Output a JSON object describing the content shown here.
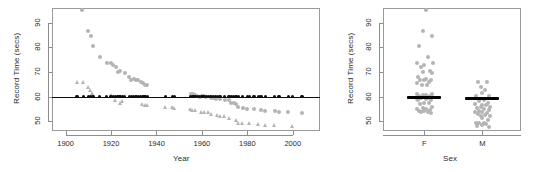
{
  "figure": {
    "background": "#ffffff",
    "point_color_gray": "#b4b4b4",
    "point_color_black": "#0d0d0d",
    "frame_color": "#9a9a9a"
  },
  "chart_data": [
    {
      "type": "scatter",
      "panel": "left",
      "title": "",
      "xlabel": "Year",
      "ylabel": "Record Time (secs)",
      "xlim": [
        1894,
        2012
      ],
      "ylim": [
        46,
        96
      ],
      "xticks": [
        1900,
        1920,
        1940,
        1960,
        1980,
        2000
      ],
      "yticks": [
        50,
        60,
        70,
        80,
        90
      ],
      "grid": false,
      "legend": "none",
      "annotations": [
        {
          "kind": "hline",
          "y": 60,
          "color": "#0d0d0d",
          "label": "reference line at 60 secs"
        }
      ],
      "series": [
        {
          "name": "Female records (circle)",
          "marker": "circle",
          "color": "#b4b4b4",
          "points": [
            [
              1907,
              95.0
            ],
            [
              1910,
              86.6
            ],
            [
              1911,
              84.8
            ],
            [
              1912,
              80.6
            ],
            [
              1915,
              76.2
            ],
            [
              1918,
              73.6
            ],
            [
              1920,
              73.6
            ],
            [
              1921,
              72.8
            ],
            [
              1922,
              72.0
            ],
            [
              1923,
              70.0
            ],
            [
              1924,
              70.2
            ],
            [
              1926,
              69.4
            ],
            [
              1928,
              68.0
            ],
            [
              1929,
              66.6
            ],
            [
              1930,
              67.2
            ],
            [
              1931,
              66.6
            ],
            [
              1932,
              66.6
            ],
            [
              1933,
              66.0
            ],
            [
              1934,
              65.4
            ],
            [
              1935,
              64.6
            ],
            [
              1936,
              64.6
            ],
            [
              1955,
              61.2
            ],
            [
              1956,
              61.2
            ],
            [
              1956,
              60.6
            ],
            [
              1957,
              60.6
            ],
            [
              1958,
              60.2
            ],
            [
              1959,
              60.0
            ],
            [
              1960,
              60.2
            ],
            [
              1961,
              60.2
            ],
            [
              1962,
              59.9
            ],
            [
              1964,
              59.5
            ],
            [
              1965,
              59.5
            ],
            [
              1966,
              58.9
            ],
            [
              1968,
              58.9
            ],
            [
              1970,
              58.5
            ],
            [
              1972,
              58.5
            ],
            [
              1973,
              57.5
            ],
            [
              1974,
              57.3
            ],
            [
              1975,
              56.9
            ],
            [
              1976,
              55.7
            ],
            [
              1978,
              55.4
            ],
            [
              1980,
              54.8
            ],
            [
              1983,
              54.8
            ],
            [
              1986,
              54.7
            ],
            [
              1988,
              54.0
            ],
            [
              1992,
              54.0
            ],
            [
              1994,
              53.6
            ],
            [
              1998,
              53.8
            ],
            [
              2004,
              53.4
            ]
          ]
        },
        {
          "name": "Male records (triangle)",
          "marker": "triangle",
          "color": "#b4b4b4",
          "points": [
            [
              1905,
              65.8
            ],
            [
              1908,
              65.8
            ],
            [
              1910,
              64.0
            ],
            [
              1911,
              62.8
            ],
            [
              1912,
              61.6
            ],
            [
              1920,
              60.4
            ],
            [
              1922,
              58.6
            ],
            [
              1924,
              57.4
            ],
            [
              1925,
              58.0
            ],
            [
              1934,
              56.8
            ],
            [
              1935,
              56.4
            ],
            [
              1936,
              56.4
            ],
            [
              1944,
              55.9
            ],
            [
              1947,
              55.8
            ],
            [
              1948,
              55.4
            ],
            [
              1955,
              54.8
            ],
            [
              1956,
              54.6
            ],
            [
              1957,
              54.3
            ],
            [
              1960,
              53.6
            ],
            [
              1961,
              53.6
            ],
            [
              1963,
              53.5
            ],
            [
              1964,
              52.9
            ],
            [
              1967,
              52.6
            ],
            [
              1968,
              52.2
            ],
            [
              1970,
              51.9
            ],
            [
              1972,
              51.2
            ],
            [
              1975,
              50.6
            ],
            [
              1976,
              49.4
            ],
            [
              1978,
              49.4
            ],
            [
              1981,
              49.4
            ],
            [
              1985,
              48.9
            ],
            [
              1988,
              48.4
            ],
            [
              1992,
              48.2
            ],
            [
              2000,
              47.8
            ]
          ]
        },
        {
          "name": "Reference markers at 60 secs",
          "marker": "filled-circle-black",
          "color": "#0d0d0d",
          "points": [
            [
              1905,
              60
            ],
            [
              1908,
              60
            ],
            [
              1910,
              60
            ],
            [
              1911,
              60
            ],
            [
              1912,
              60
            ],
            [
              1915,
              60
            ],
            [
              1918,
              60
            ],
            [
              1920,
              60
            ],
            [
              1921,
              60
            ],
            [
              1922,
              60
            ],
            [
              1923,
              60
            ],
            [
              1924,
              60
            ],
            [
              1925,
              60
            ],
            [
              1926,
              60
            ],
            [
              1928,
              60
            ],
            [
              1929,
              60
            ],
            [
              1930,
              60
            ],
            [
              1931,
              60
            ],
            [
              1932,
              60
            ],
            [
              1933,
              60
            ],
            [
              1934,
              60
            ],
            [
              1935,
              60
            ],
            [
              1936,
              60
            ],
            [
              1944,
              60
            ],
            [
              1947,
              60
            ],
            [
              1948,
              60
            ],
            [
              1955,
              60
            ],
            [
              1956,
              60
            ],
            [
              1957,
              60
            ],
            [
              1958,
              60
            ],
            [
              1959,
              60
            ],
            [
              1960,
              60
            ],
            [
              1961,
              60
            ],
            [
              1962,
              60
            ],
            [
              1963,
              60
            ],
            [
              1964,
              60
            ],
            [
              1965,
              60
            ],
            [
              1966,
              60
            ],
            [
              1967,
              60
            ],
            [
              1968,
              60
            ],
            [
              1970,
              60
            ],
            [
              1972,
              60
            ],
            [
              1973,
              60
            ],
            [
              1974,
              60
            ],
            [
              1975,
              60
            ],
            [
              1976,
              60
            ],
            [
              1978,
              60
            ],
            [
              1980,
              60
            ],
            [
              1981,
              60
            ],
            [
              1983,
              60
            ],
            [
              1985,
              60
            ],
            [
              1986,
              60
            ],
            [
              1988,
              60
            ],
            [
              1992,
              60
            ],
            [
              1994,
              60
            ],
            [
              1998,
              60
            ],
            [
              2000,
              60
            ],
            [
              2004,
              60
            ]
          ]
        }
      ]
    },
    {
      "type": "scatter",
      "panel": "right",
      "title": "",
      "xlabel": "Sex",
      "ylabel": "Record Time (secs)",
      "categories": [
        "F",
        "M"
      ],
      "ylim": [
        46,
        96
      ],
      "yticks": [
        50,
        60,
        70,
        80,
        90
      ],
      "grid": false,
      "legend": "none",
      "annotations": [
        {
          "kind": "median-bar",
          "category": "F",
          "y": 59.5,
          "color": "#000000"
        },
        {
          "kind": "median-bar",
          "category": "M",
          "y": 59.4,
          "color": "#000000"
        }
      ],
      "series": [
        {
          "name": "F",
          "marker": "circle",
          "color": "#b4b4b4",
          "jitter": [
            [
              0.05,
              95.0
            ],
            [
              -0.05,
              86.6
            ],
            [
              0.2,
              84.8
            ],
            [
              -0.15,
              80.6
            ],
            [
              0.1,
              76.2
            ],
            [
              -0.2,
              73.6
            ],
            [
              0.25,
              73.6
            ],
            [
              0.0,
              72.8
            ],
            [
              -0.1,
              72.0
            ],
            [
              0.15,
              70.2
            ],
            [
              -0.05,
              70.0
            ],
            [
              0.22,
              69.4
            ],
            [
              -0.18,
              68.0
            ],
            [
              0.05,
              67.2
            ],
            [
              0.18,
              66.6
            ],
            [
              -0.12,
              66.6
            ],
            [
              0.0,
              66.6
            ],
            [
              0.12,
              66.0
            ],
            [
              -0.22,
              65.4
            ],
            [
              0.08,
              64.6
            ],
            [
              -0.08,
              64.6
            ],
            [
              0.2,
              61.2
            ],
            [
              -0.2,
              61.2
            ],
            [
              0.05,
              60.6
            ],
            [
              -0.05,
              60.6
            ],
            [
              0.15,
              60.2
            ],
            [
              -0.15,
              60.2
            ],
            [
              0.0,
              60.0
            ],
            [
              0.22,
              59.9
            ],
            [
              -0.1,
              59.5
            ],
            [
              0.1,
              59.5
            ],
            [
              -0.22,
              58.9
            ],
            [
              0.05,
              58.9
            ],
            [
              0.18,
              58.5
            ],
            [
              -0.18,
              58.5
            ],
            [
              0.0,
              57.5
            ],
            [
              0.12,
              57.3
            ],
            [
              -0.12,
              56.9
            ],
            [
              0.2,
              55.7
            ],
            [
              -0.05,
              55.4
            ],
            [
              0.05,
              54.8
            ],
            [
              -0.2,
              54.8
            ],
            [
              0.15,
              54.7
            ],
            [
              -0.15,
              54.0
            ],
            [
              0.0,
              54.0
            ],
            [
              0.1,
              53.8
            ],
            [
              -0.1,
              53.6
            ],
            [
              0.18,
              53.4
            ]
          ]
        },
        {
          "name": "M",
          "marker": "circle",
          "color": "#b4b4b4",
          "jitter": [
            [
              -0.12,
              65.8
            ],
            [
              0.12,
              65.8
            ],
            [
              -0.05,
              64.0
            ],
            [
              0.08,
              62.8
            ],
            [
              0.0,
              61.6
            ],
            [
              -0.18,
              60.4
            ],
            [
              0.18,
              60.4
            ],
            [
              0.05,
              58.6
            ],
            [
              -0.1,
              58.0
            ],
            [
              0.15,
              57.4
            ],
            [
              -0.2,
              56.8
            ],
            [
              0.0,
              56.4
            ],
            [
              0.1,
              56.4
            ],
            [
              -0.05,
              55.9
            ],
            [
              0.2,
              55.8
            ],
            [
              -0.15,
              55.4
            ],
            [
              0.05,
              54.8
            ],
            [
              0.18,
              54.6
            ],
            [
              -0.08,
              54.3
            ],
            [
              0.0,
              53.6
            ],
            [
              -0.2,
              53.6
            ],
            [
              0.12,
              53.5
            ],
            [
              -0.12,
              52.9
            ],
            [
              0.08,
              52.6
            ],
            [
              0.2,
              52.2
            ],
            [
              -0.05,
              51.9
            ],
            [
              0.0,
              51.2
            ],
            [
              0.15,
              50.6
            ],
            [
              -0.18,
              49.4
            ],
            [
              0.05,
              49.4
            ],
            [
              -0.1,
              49.4
            ],
            [
              0.1,
              48.9
            ],
            [
              0.0,
              48.4
            ],
            [
              -0.15,
              48.2
            ],
            [
              0.18,
              47.8
            ]
          ]
        }
      ]
    }
  ]
}
